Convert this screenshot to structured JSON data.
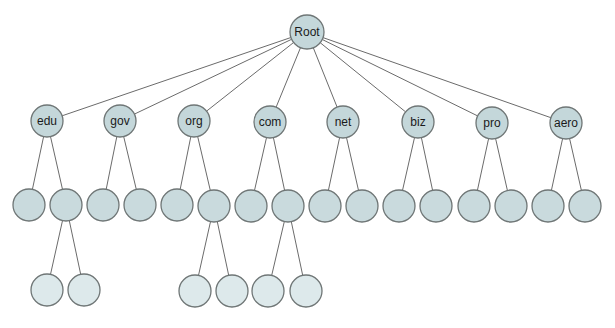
{
  "diagram": {
    "type": "tree",
    "title": "",
    "colors": {
      "labeled_fill": "#c4d7da",
      "inner_fill": "#c9dadd",
      "leaf_fill": "#dde9eb",
      "stroke": "#6f7676",
      "edge": "#6b6b6b"
    },
    "root": {
      "id": "root",
      "label": "Root",
      "x": 307,
      "y": 32,
      "r": 17
    },
    "level1": [
      {
        "id": "edu",
        "label": "edu",
        "x": 47,
        "y": 121,
        "r": 16
      },
      {
        "id": "gov",
        "label": "gov",
        "x": 120,
        "y": 121,
        "r": 16
      },
      {
        "id": "org",
        "label": "org",
        "x": 194,
        "y": 121,
        "r": 16
      },
      {
        "id": "com",
        "label": "com",
        "x": 270,
        "y": 122,
        "r": 16
      },
      {
        "id": "net",
        "label": "net",
        "x": 343,
        "y": 122,
        "r": 16
      },
      {
        "id": "biz",
        "label": "biz",
        "x": 418,
        "y": 122,
        "r": 16
      },
      {
        "id": "pro",
        "label": "pro",
        "x": 492,
        "y": 123,
        "r": 16
      },
      {
        "id": "aero",
        "label": "aero",
        "x": 566,
        "y": 123,
        "r": 16
      }
    ],
    "level2": [
      {
        "id": "edu-1",
        "parent": "edu",
        "label": "",
        "x": 29,
        "y": 205,
        "r": 16
      },
      {
        "id": "edu-2",
        "parent": "edu",
        "label": "",
        "x": 66,
        "y": 205,
        "r": 16
      },
      {
        "id": "gov-1",
        "parent": "gov",
        "label": "",
        "x": 103,
        "y": 205,
        "r": 16
      },
      {
        "id": "gov-2",
        "parent": "gov",
        "label": "",
        "x": 140,
        "y": 205,
        "r": 16
      },
      {
        "id": "org-1",
        "parent": "org",
        "label": "",
        "x": 177,
        "y": 205,
        "r": 16
      },
      {
        "id": "org-2",
        "parent": "org",
        "label": "",
        "x": 214,
        "y": 206,
        "r": 16
      },
      {
        "id": "com-1",
        "parent": "com",
        "label": "",
        "x": 251,
        "y": 206,
        "r": 16
      },
      {
        "id": "com-2",
        "parent": "com",
        "label": "",
        "x": 288,
        "y": 206,
        "r": 16
      },
      {
        "id": "net-1",
        "parent": "net",
        "label": "",
        "x": 325,
        "y": 206,
        "r": 16
      },
      {
        "id": "net-2",
        "parent": "net",
        "label": "",
        "x": 362,
        "y": 206,
        "r": 16
      },
      {
        "id": "biz-1",
        "parent": "biz",
        "label": "",
        "x": 399,
        "y": 206,
        "r": 16
      },
      {
        "id": "biz-2",
        "parent": "biz",
        "label": "",
        "x": 436,
        "y": 206,
        "r": 16
      },
      {
        "id": "pro-1",
        "parent": "pro",
        "label": "",
        "x": 474,
        "y": 206,
        "r": 16
      },
      {
        "id": "pro-2",
        "parent": "pro",
        "label": "",
        "x": 511,
        "y": 206,
        "r": 16
      },
      {
        "id": "aero-1",
        "parent": "aero",
        "label": "",
        "x": 548,
        "y": 206,
        "r": 16
      },
      {
        "id": "aero-2",
        "parent": "aero",
        "label": "",
        "x": 585,
        "y": 206,
        "r": 16
      }
    ],
    "level3": [
      {
        "id": "edu-2-1",
        "parent": "edu-2",
        "label": "",
        "x": 47,
        "y": 290,
        "r": 16
      },
      {
        "id": "edu-2-2",
        "parent": "edu-2",
        "label": "",
        "x": 84,
        "y": 290,
        "r": 16
      },
      {
        "id": "org-2-1",
        "parent": "org-2",
        "label": "",
        "x": 195,
        "y": 291,
        "r": 16
      },
      {
        "id": "org-2-2",
        "parent": "org-2",
        "label": "",
        "x": 232,
        "y": 291,
        "r": 16
      },
      {
        "id": "com-2-1",
        "parent": "com-2",
        "label": "",
        "x": 268,
        "y": 291,
        "r": 16
      },
      {
        "id": "com-2-2",
        "parent": "com-2",
        "label": "",
        "x": 306,
        "y": 291,
        "r": 16
      }
    ]
  }
}
